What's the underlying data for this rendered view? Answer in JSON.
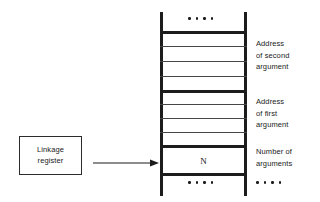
{
  "diagram": {
    "linkage_register": {
      "line1": "Linkage",
      "line2": "register",
      "arrow_icon": "arrow-right-icon"
    },
    "stack": {
      "top_ellipsis": "....",
      "bottom_ellipsis": "....",
      "cell_value": "N",
      "sections": [
        {
          "name": "second-argument-address",
          "cells": 4
        },
        {
          "name": "first-argument-address",
          "cells": 4
        },
        {
          "name": "argument-count",
          "cells": 1
        }
      ]
    },
    "annotations": [
      {
        "name": "second-argument-address",
        "lines": [
          "Address",
          "of second",
          "argument"
        ]
      },
      {
        "name": "first-argument-address",
        "lines": [
          "Address",
          "of first",
          "argument"
        ]
      },
      {
        "name": "argument-count",
        "lines": [
          "Number of",
          "arguments"
        ]
      }
    ],
    "annotation_ellipsis": "....",
    "colors": {
      "ink": "#1c1c1c",
      "thin_rule": "#474747",
      "background": "#ffffff"
    }
  }
}
